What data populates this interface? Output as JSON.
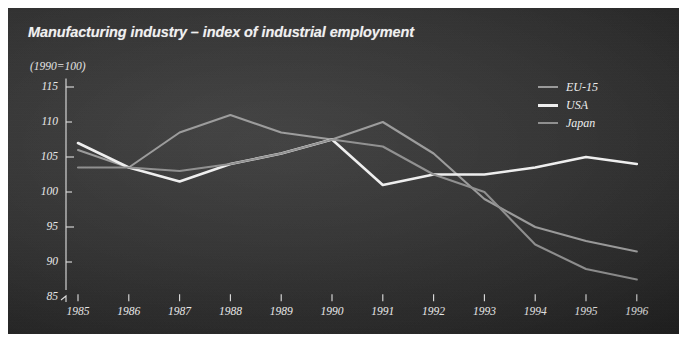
{
  "figure": {
    "title": "Manufacturing industry – index of industrial employment",
    "subtitle": "(1990=100)",
    "panel_bg": "#2f2f2f",
    "text_color": "#ececec"
  },
  "legend": {
    "position": "top-right",
    "entries": [
      {
        "label": "EU-15",
        "color": "#9a9a9a",
        "icon": "line-swatch"
      },
      {
        "label": "USA",
        "color": "#f2f2f2",
        "icon": "line-swatch"
      },
      {
        "label": "Japan",
        "color": "#8e8e8e",
        "icon": "line-swatch"
      }
    ]
  },
  "axes": {
    "y_ticks": [
      "115",
      "110",
      "105",
      "100",
      "95",
      "90",
      "85"
    ],
    "x_ticks": [
      "1985",
      "1986",
      "1987",
      "1988",
      "1989",
      "1990",
      "1991",
      "1992",
      "1993",
      "1994",
      "1995",
      "1996"
    ],
    "y_axis_break": true
  },
  "chart_data": {
    "type": "line",
    "title": "Manufacturing industry – index of industrial employment",
    "subtitle": "(1990=100)",
    "xlabel": "",
    "ylabel": "",
    "ylim": [
      85,
      115
    ],
    "grid": false,
    "legend_position": "top-right",
    "x": [
      "1985",
      "1986",
      "1987",
      "1988",
      "1989",
      "1990",
      "1991",
      "1992",
      "1993",
      "1994",
      "1995",
      "1996"
    ],
    "series": [
      {
        "name": "EU-15",
        "color": "#9a9a9a",
        "values": [
          106.0,
          103.5,
          108.5,
          111.0,
          108.5,
          107.5,
          110.0,
          105.5,
          99.0,
          95.0,
          93.0,
          91.5
        ]
      },
      {
        "name": "USA",
        "color": "#f2f2f2",
        "values": [
          107.0,
          103.5,
          101.5,
          104.0,
          105.5,
          107.5,
          101.0,
          102.5,
          102.5,
          103.5,
          105.0,
          104.0
        ]
      },
      {
        "name": "Japan",
        "color": "#8e8e8e",
        "values": [
          103.5,
          103.5,
          103.0,
          104.0,
          105.5,
          107.5,
          106.5,
          102.5,
          100.0,
          92.5,
          89.0,
          87.5
        ]
      }
    ]
  }
}
